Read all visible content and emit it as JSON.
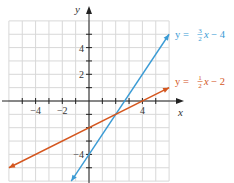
{
  "chart_data": {
    "type": "line",
    "title": "",
    "xlabel": "x",
    "ylabel": "y",
    "xlim": [
      -6,
      6
    ],
    "ylim": [
      -6,
      6
    ],
    "grid": true,
    "x_ticks": [
      -4,
      -2,
      4
    ],
    "y_ticks": [
      4,
      2,
      -4
    ],
    "series": [
      {
        "name": "y = (3/2)x − 4",
        "slope": 1.5,
        "intercept": -4,
        "color": "#3a9bd5",
        "x": [
          -1.33,
          6
        ],
        "y": [
          -6,
          5
        ],
        "label": {
          "prefix": "y = ",
          "num": "3",
          "den": "2",
          "suffix": "x − 4"
        }
      },
      {
        "name": "y = (1/2)x − 2",
        "slope": 0.5,
        "intercept": -2,
        "color": "#d4561e",
        "x": [
          -6,
          6
        ],
        "y": [
          -5,
          1
        ],
        "label": {
          "prefix": "y = ",
          "num": "1",
          "den": "2",
          "suffix": "x − 2"
        }
      }
    ],
    "intersection": {
      "x": 2,
      "y": -1
    }
  }
}
